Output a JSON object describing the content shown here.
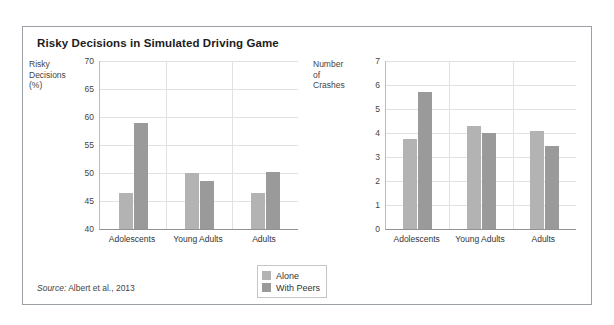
{
  "figure": {
    "title": "Risky Decisions in Simulated Driving Game",
    "source_word": "Source:",
    "source_text": " Albert et al., 2013"
  },
  "legend": {
    "entries": [
      {
        "label": "Alone",
        "color": "#b3b3b3"
      },
      {
        "label": "With Peers",
        "color": "#9a9a9a"
      }
    ]
  },
  "chart_data": [
    {
      "type": "bar",
      "title": "Risky Decisions in Simulated Driving Game",
      "panel": "left",
      "ylabel": "Risky\nDecisions\n(%)",
      "xlabel": "",
      "categories": [
        "Adolescents",
        "Young Adults",
        "Adults"
      ],
      "series": [
        {
          "name": "Alone",
          "color": "#b3b3b3",
          "values": [
            46.4,
            50.0,
            46.4
          ]
        },
        {
          "name": "With Peers",
          "color": "#9a9a9a",
          "values": [
            58.9,
            48.5,
            50.1
          ]
        }
      ],
      "ylim": [
        40,
        70
      ],
      "yticks": [
        40,
        45,
        50,
        55,
        60,
        65,
        70
      ],
      "grid": true,
      "legend_position": "bottom-center"
    },
    {
      "type": "bar",
      "panel": "right",
      "ylabel": "Number of\nCrashes",
      "xlabel": "",
      "categories": [
        "Adolescents",
        "Young Adults",
        "Adults"
      ],
      "series": [
        {
          "name": "Alone",
          "color": "#b3b3b3",
          "values": [
            3.75,
            4.3,
            4.1
          ]
        },
        {
          "name": "With Peers",
          "color": "#9a9a9a",
          "values": [
            5.7,
            4.0,
            3.45
          ]
        }
      ],
      "ylim": [
        0,
        7
      ],
      "yticks": [
        0,
        1,
        2,
        3,
        4,
        5,
        6,
        7
      ],
      "grid": true,
      "legend_position": "bottom-center"
    }
  ]
}
